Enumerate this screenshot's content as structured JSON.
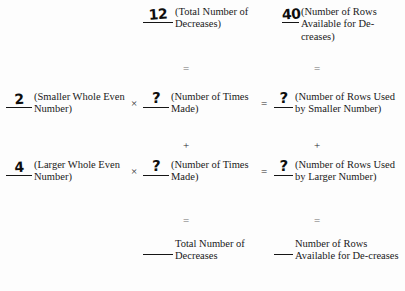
{
  "worksheet": {
    "title": "Decrease Calculation Worksheet",
    "top_row": {
      "total_decreases": {
        "value": "12",
        "label": "(Total Number of Decreases)"
      },
      "rows_available": {
        "value": "40",
        "label": "(Number of Rows Available for De-creases)"
      }
    },
    "connector_equals_upper_mid": "=",
    "connector_equals_upper_right": "=",
    "row_smaller": {
      "number": {
        "value": "2",
        "label": "(Smaller Whole Even Number)"
      },
      "times_operator": "×",
      "times_made": {
        "value": "?",
        "label": "(Number of Times Made)"
      },
      "equals_operator": "=",
      "rows_used": {
        "value": "?",
        "label": "(Number of Rows Used by Smaller Number)"
      }
    },
    "connector_plus_mid": "+",
    "connector_plus_right": "+",
    "row_larger": {
      "number": {
        "value": "4",
        "label": "(Larger Whole Even Number)"
      },
      "times_operator": "×",
      "times_made": {
        "value": "?",
        "label": "(Number of Times Made)"
      },
      "equals_operator": "=",
      "rows_used": {
        "value": "?",
        "label": "(Number of Rows Used by Larger Number)"
      }
    },
    "connector_equals_lower_mid": "=",
    "connector_equals_lower_right": "=",
    "bottom_row": {
      "total_decreases": {
        "value": "",
        "label": "Total Number of Decreases"
      },
      "rows_available": {
        "value": "",
        "label": "Number of Rows Available for De-creases"
      }
    }
  },
  "colors": {
    "page_background": "#fdfdfd",
    "print_ink": "#1a1a1a",
    "hand_ink": "#0d0d0d",
    "faint_ink": "#6d6d6d"
  }
}
